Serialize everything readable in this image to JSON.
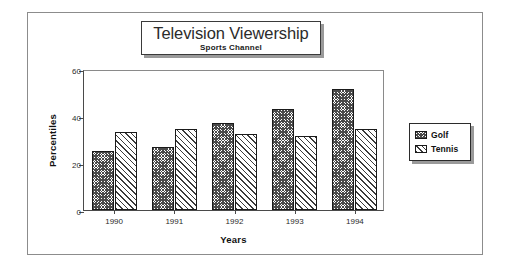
{
  "chart_data": {
    "type": "bar",
    "title": "Television Viewership",
    "subtitle": "Sports Channel",
    "xlabel": "Years",
    "ylabel": "Percentiles",
    "categories": [
      "1990",
      "1991",
      "1992",
      "1993",
      "1994"
    ],
    "series": [
      {
        "name": "Golf",
        "values": [
          25,
          27,
          37,
          43,
          51.5
        ],
        "pattern": "cross-hatch"
      },
      {
        "name": "Tennis",
        "values": [
          33,
          34.5,
          32.5,
          31.5,
          34.5
        ],
        "pattern": "diagonal-stripe"
      }
    ],
    "ylim": [
      0,
      60
    ],
    "yticks": [
      "0",
      "20",
      "40",
      "60"
    ],
    "ytick_values": [
      0,
      20,
      40,
      60
    ],
    "grid": false,
    "legend_position": "right",
    "colors": {
      "frame": "#8c8c8c",
      "axis": "#4a4a4a",
      "bar_outline": "#1a1a1a",
      "text": "#111111",
      "background": "#ffffff"
    }
  },
  "legend": {
    "items": [
      {
        "label": "Golf",
        "swatch": "cross-hatch-swatch"
      },
      {
        "label": "Tennis",
        "swatch": "diagonal-stripe-swatch"
      }
    ]
  }
}
